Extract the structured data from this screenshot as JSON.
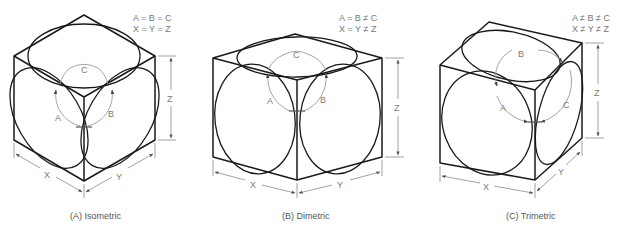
{
  "figure": {
    "panels": [
      {
        "id": "isometric",
        "caption": "(A) Isometric",
        "equations": [
          "A = B = C",
          "X = Y = Z"
        ],
        "angle_labels": {
          "a": "A",
          "b": "B",
          "c": "C"
        },
        "dimension_labels": {
          "x": "X",
          "y": "Y",
          "z": "Z"
        }
      },
      {
        "id": "dimetric",
        "caption": "(B) Dimetric",
        "equations": [
          "A = B ≠ C",
          "X = Y ≠ Z"
        ],
        "angle_labels": {
          "a": "A",
          "b": "B",
          "c": "C"
        },
        "dimension_labels": {
          "x": "X",
          "y": "Y",
          "z": "Z"
        }
      },
      {
        "id": "trimetric",
        "caption": "(C) Trimetric",
        "equations": [
          "A ≠ B ≠ C",
          "X ≠ Y ≠ Z"
        ],
        "angle_labels": {
          "a": "A",
          "b": "B",
          "c": "C"
        },
        "dimension_labels": {
          "x": "X",
          "y": "Y",
          "z": "Z"
        }
      }
    ]
  }
}
